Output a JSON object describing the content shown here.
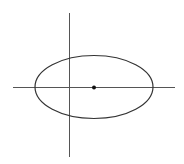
{
  "diagram": {
    "title": "",
    "colors": {
      "axis": "#555555",
      "ellipse": "#333333",
      "center_point": "#111111",
      "background": "#ffffff"
    },
    "elements": {
      "x_axis": "horizontal axis",
      "y_axis": "vertical axis",
      "ellipse": "ellipse",
      "center_point": "center"
    }
  }
}
